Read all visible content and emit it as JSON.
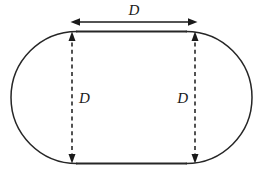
{
  "figure": {
    "background_color": "#ffffff",
    "stroke_color": "#262626",
    "label_color": "#1a1a1a"
  },
  "shape": {
    "name": "stadium",
    "description": "Rectangle with semicircular caps on left and right",
    "outline_only": true,
    "bounds": {
      "left": 11,
      "top": 31,
      "right": 252,
      "bottom": 164
    },
    "cap_radius": 66,
    "straight_span": {
      "x_start": 77,
      "x_end": 186
    }
  },
  "dimensions": [
    {
      "id": "top-width",
      "label": "D",
      "orientation": "horizontal",
      "arrowheads": "both",
      "line_style": "solid",
      "y": 22,
      "x_start": 72,
      "x_end": 196,
      "label_x": 134,
      "label_y": 15,
      "label_anchor": "middle"
    },
    {
      "id": "left-height",
      "label": "D",
      "orientation": "vertical",
      "arrowheads": "both",
      "line_style": "dashed",
      "x": 72,
      "y_start": 32,
      "y_end": 163,
      "label_x": 79,
      "label_y": 103,
      "label_anchor": "start"
    },
    {
      "id": "right-height",
      "label": "D",
      "orientation": "vertical",
      "arrowheads": "both",
      "line_style": "dashed",
      "x": 195,
      "y_start": 32,
      "y_end": 163,
      "label_x": 188,
      "label_y": 103,
      "label_anchor": "end"
    }
  ]
}
